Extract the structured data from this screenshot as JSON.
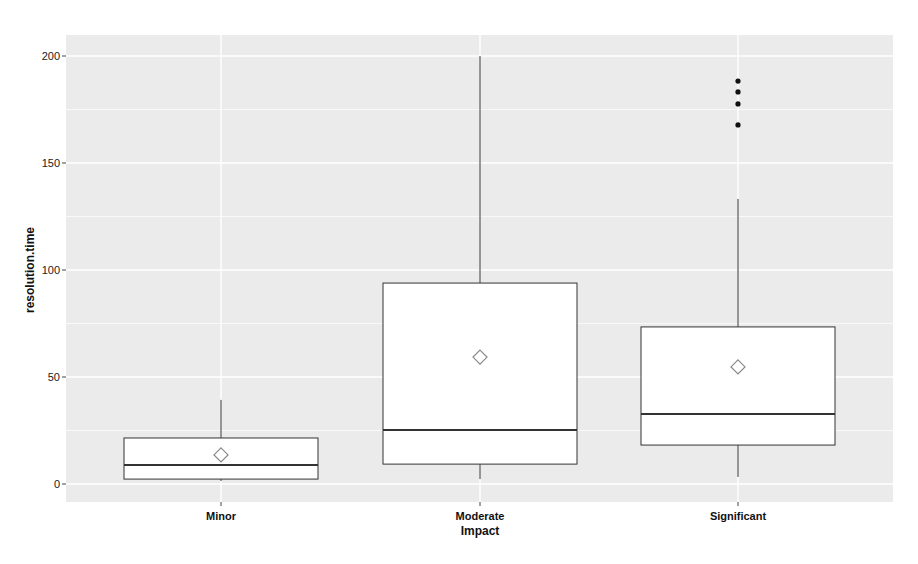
{
  "chart_data": {
    "type": "box",
    "title": "",
    "xlabel": "Impact",
    "ylabel": "resolution.time",
    "categories": [
      "Minor",
      "Moderate",
      "Significant"
    ],
    "ylim": [
      -8,
      208
    ],
    "yticks": [
      0,
      50,
      100,
      150,
      200
    ],
    "grid": true,
    "legend": null,
    "boxes": [
      {
        "category": "Minor",
        "whisker_low": 1.4,
        "q1": 2.3,
        "median": 8.9,
        "q3": 21.5,
        "whisker_high": 39.3,
        "mean": 13.6,
        "outliers": []
      },
      {
        "category": "Moderate",
        "whisker_low": 2.3,
        "q1": 9.3,
        "median": 25.2,
        "q3": 93.9,
        "whisker_high": 200.0,
        "mean": 59.3,
        "outliers": []
      },
      {
        "category": "Significant",
        "whisker_low": 3.3,
        "q1": 18.2,
        "median": 32.7,
        "q3": 73.4,
        "whisker_high": 133.2,
        "mean": 54.7,
        "outliers": [
          167.8,
          177.6,
          183.2,
          188.3
        ]
      }
    ],
    "mean_marker": "diamond"
  },
  "colors": {
    "panel_bg": "#ebebeb",
    "grid": "#ffffff",
    "box_fill": "#ffffff",
    "box_stroke": "#333333",
    "mean_marker": "#888888",
    "outlier": "#111111"
  }
}
